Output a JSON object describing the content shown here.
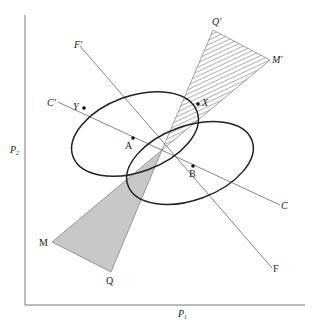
{
  "axes": {
    "y_label": "P",
    "y_sub": "2",
    "x_label": "P",
    "x_sub": "1"
  },
  "lines": {
    "f_start": "F′",
    "f_end": "F",
    "c_start": "C′",
    "c_end": "C"
  },
  "cones": {
    "upper_a": "Q′",
    "upper_b": "M′",
    "lower_a": "M",
    "lower_b": "Q"
  },
  "points": {
    "x": "X",
    "y": "Y",
    "a": "A",
    "b": "B"
  },
  "colors": {
    "line": "#555555",
    "ellipse": "#222222",
    "shade": "#c8c8c8",
    "hatch": "#444444"
  }
}
